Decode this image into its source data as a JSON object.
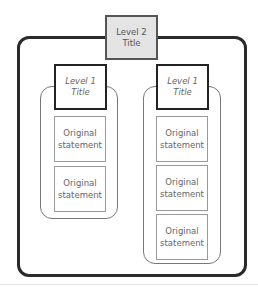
{
  "diagram": {
    "level2": {
      "label": "Level 2\nTitle"
    },
    "groups": [
      {
        "level1": {
          "label": "Level 1\nTitle"
        },
        "statements": [
          "Original\nstatement",
          "Original\nstatement"
        ]
      },
      {
        "level1": {
          "label": "Level 1\nTitle"
        },
        "statements": [
          "Original\nstatement",
          "Original\nstatement",
          "Original\nstatement"
        ]
      }
    ]
  },
  "colors": {
    "outer_border": "#2a2a2a",
    "level2_fill": "#e4e4e4",
    "level1_border": "#222222",
    "statement_border": "#999999",
    "group_border": "#777777"
  }
}
